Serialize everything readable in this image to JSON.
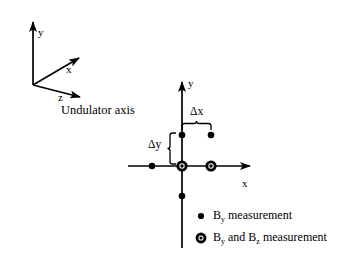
{
  "figure": {
    "caption_text": "Undulator axis",
    "background_color": "#ffffff",
    "ink_color": "#000000"
  },
  "frame3d": {
    "name": "3d-coordinate-frame",
    "origin": {
      "x": 33,
      "y": 85
    },
    "axes": [
      {
        "id": "y",
        "label": "y",
        "tip": {
          "x": 33,
          "y": 18
        },
        "label_pos": {
          "x": 38,
          "y": 27
        }
      },
      {
        "id": "x",
        "label": "x",
        "tip": {
          "x": 84,
          "y": 56
        },
        "label_pos": {
          "x": 66,
          "y": 64
        }
      },
      {
        "id": "z",
        "label": "z",
        "tip": {
          "x": 86,
          "y": 99
        },
        "label_pos": {
          "x": 58,
          "y": 92
        }
      }
    ]
  },
  "plot2d": {
    "name": "measurement-grid",
    "origin": {
      "x": 182,
      "y": 166
    },
    "x_axis": {
      "label": "x",
      "from_x": 128,
      "to_x": 256,
      "label_pos": {
        "x": 242,
        "y": 178
      }
    },
    "y_axis": {
      "label": "y",
      "from_y": 248,
      "to_y": 76,
      "label_pos": {
        "x": 188,
        "y": 78
      }
    },
    "annotations": [
      {
        "id": "delta-x",
        "label": "Δx",
        "label_pos": {
          "x": 196,
          "y": 112
        },
        "span_from_x": 182,
        "span_to_x": 211,
        "span_y": 128
      },
      {
        "id": "delta-y",
        "label": "Δy",
        "label_pos": {
          "x": 152,
          "y": 144
        },
        "span_from_y": 135,
        "span_to_y": 166,
        "span_x": 172
      }
    ],
    "points": [
      {
        "id": "p-left-axis",
        "x": 152,
        "y": 166,
        "kind": "by"
      },
      {
        "id": "p-upper-left",
        "x": 182,
        "y": 135,
        "kind": "by"
      },
      {
        "id": "p-upper-right",
        "x": 211,
        "y": 135,
        "kind": "by"
      },
      {
        "id": "p-lower-axis",
        "x": 182,
        "y": 196,
        "kind": "by"
      },
      {
        "id": "p-origin",
        "x": 182,
        "y": 166,
        "kind": "by-and-bz"
      },
      {
        "id": "p-right-axis",
        "x": 211,
        "y": 166,
        "kind": "by-and-bz"
      }
    ]
  },
  "legend": {
    "name": "measurement-legend",
    "entries": [
      {
        "id": "legend-by",
        "marker": "small-dot",
        "pre": "B",
        "sub1": "y",
        "post": " measurement",
        "marker_pos": {
          "x": 201,
          "y": 216
        },
        "text_pos": {
          "x": 213,
          "y": 210
        }
      },
      {
        "id": "legend-by-bz",
        "marker": "ringed-dot",
        "pre": "B",
        "sub1": "y",
        "mid": " and B",
        "sub2": "z",
        "post": " measurement",
        "marker_pos": {
          "x": 201,
          "y": 238
        },
        "text_pos": {
          "x": 213,
          "y": 232
        }
      }
    ]
  }
}
